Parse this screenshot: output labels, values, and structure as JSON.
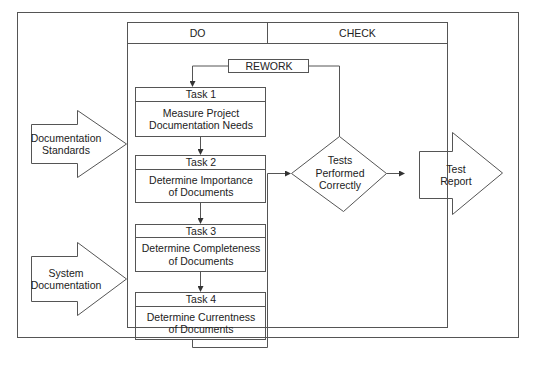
{
  "diagram": {
    "type": "flowchart",
    "columns": {
      "do": "DO",
      "check": "CHECK"
    },
    "inputs": [
      {
        "id": "documentation-standards",
        "lines": [
          "Documentation",
          "Standards"
        ]
      },
      {
        "id": "system-documentation",
        "lines": [
          "System",
          "Documentation"
        ]
      }
    ],
    "tasks": [
      {
        "title": "Task 1",
        "lines": [
          "Measure Project",
          "Documentation Needs"
        ]
      },
      {
        "title": "Task 2",
        "lines": [
          "Determine Importance",
          "of Documents"
        ]
      },
      {
        "title": "Task 3",
        "lines": [
          "Determine Completeness",
          "of Documents"
        ]
      },
      {
        "title": "Task 4",
        "lines": [
          "Determine Currentness",
          "of Documents"
        ]
      }
    ],
    "rework": "REWORK",
    "decision": {
      "lines": [
        "Tests",
        "Performed",
        "Correctly"
      ]
    },
    "output": {
      "lines": [
        "Test",
        "Report"
      ]
    },
    "colors": {
      "line": "#444444",
      "background": "#ffffff"
    }
  }
}
